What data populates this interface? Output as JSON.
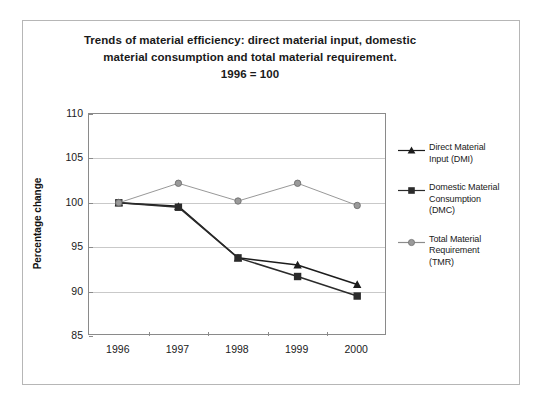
{
  "chart_data": {
    "type": "line",
    "title": "Trends of material efficiency: direct material input, domestic material consumption and total material requirement. 1996 = 100",
    "title_lines": [
      "Trends of material efficiency: direct material input, domestic",
      "material consumption and total material requirement.",
      "1996 = 100"
    ],
    "xlabel": "",
    "ylabel": "Percentage change",
    "categories": [
      "1996",
      "1997",
      "1998",
      "1999",
      "2000"
    ],
    "x": [
      1996,
      1997,
      1998,
      1999,
      2000
    ],
    "ylim": [
      85,
      110
    ],
    "y_ticks": [
      85,
      90,
      95,
      100,
      105,
      110
    ],
    "grid": true,
    "legend_position": "right",
    "series": [
      {
        "name": "Direct Material Input (DMI)",
        "name_lines": [
          "Direct Material",
          "Input (DMI)"
        ],
        "marker": "triangle",
        "color": "#1c1c1c",
        "values": [
          100.0,
          99.6,
          93.8,
          93.0,
          90.8
        ]
      },
      {
        "name": "Domestic Material Consumption (DMC)",
        "name_lines": [
          "Domestic Material",
          "Consumption",
          "(DMC)"
        ],
        "marker": "square",
        "color": "#2b2b2b",
        "values": [
          100.0,
          99.5,
          93.8,
          91.7,
          89.5
        ]
      },
      {
        "name": "Total Material Requirement (TMR)",
        "name_lines": [
          "Total Material",
          "Requirement",
          "(TMR)"
        ],
        "marker": "circle",
        "color": "#8c8c8c",
        "values": [
          100.0,
          102.2,
          100.2,
          102.2,
          99.7
        ]
      }
    ]
  },
  "axes": {
    "y_tick_labels": [
      "110",
      "105",
      "100",
      "95",
      "90",
      "85"
    ],
    "x_tick_labels": [
      "1996",
      "1997",
      "1998",
      "1999",
      "2000"
    ]
  },
  "legend": {
    "entries": [
      {
        "line1": "Direct Material",
        "line2": "Input (DMI)",
        "line3": ""
      },
      {
        "line1": "Domestic Material",
        "line2": "Consumption",
        "line3": "(DMC)"
      },
      {
        "line1": "Total Material",
        "line2": "Requirement",
        "line3": "(TMR)"
      }
    ]
  },
  "colors": {
    "dmi": "#1c1c1c",
    "dmc": "#2b2b2b",
    "tmr": "#8c8c8c",
    "grid": "#c9c9c9",
    "axis": "#8a8a8a",
    "frame": "#b6b6b6",
    "text": "#1a1a1a"
  }
}
